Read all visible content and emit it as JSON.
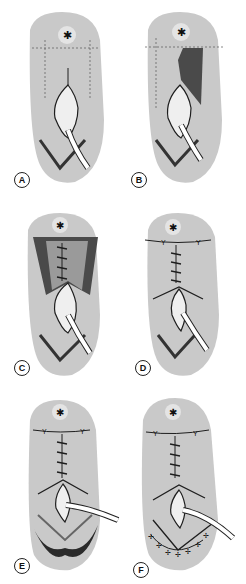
{
  "figure": {
    "colors": {
      "skin": "#c9c9c9",
      "skin_light": "#e4e4e4",
      "flap_dark": "#4a4a4a",
      "line": "#1e1e1e",
      "drain": "#ffffff",
      "stoma": "#efefef"
    },
    "panels": [
      {
        "id": "A",
        "label": "A",
        "step": "incision outline with dashed flap markings, drain in place"
      },
      {
        "id": "B",
        "label": "B",
        "step": "right flap raised (shaded)"
      },
      {
        "id": "C",
        "label": "C",
        "step": "both flaps raised, midline sutures placed"
      },
      {
        "id": "D",
        "label": "D",
        "step": "flaps closed, transverse and midline sutures"
      },
      {
        "id": "E",
        "label": "E",
        "step": "lower V-shaped wound edge excised"
      },
      {
        "id": "F",
        "label": "F",
        "step": "lower V wound closed with interrupted sutures"
      }
    ]
  }
}
